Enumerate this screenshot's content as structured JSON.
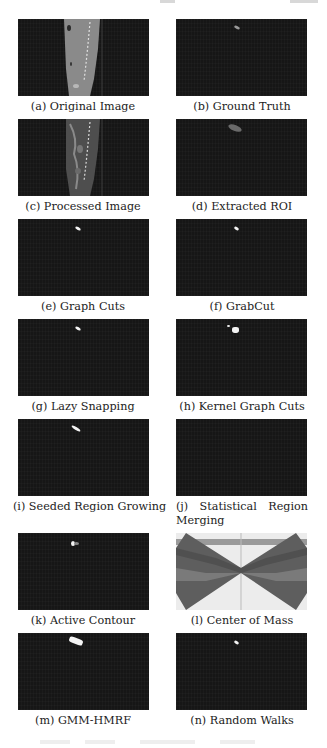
{
  "figure": {
    "panels": [
      {
        "id": "a",
        "caption": "(a) Original Image"
      },
      {
        "id": "b",
        "caption": "(b) Ground Truth"
      },
      {
        "id": "c",
        "caption": "(c) Processed Image"
      },
      {
        "id": "d",
        "caption": "(d) Extracted ROI"
      },
      {
        "id": "e",
        "caption": "(e) Graph Cuts"
      },
      {
        "id": "f",
        "caption": "(f) GrabCut"
      },
      {
        "id": "g",
        "caption": "(g) Lazy Snapping"
      },
      {
        "id": "h",
        "caption": "(h) Kernel Graph Cuts"
      },
      {
        "id": "i",
        "caption": "(i) Seeded Region Growing"
      },
      {
        "id": "j",
        "caption_parts": [
          "(j)",
          "Statistical",
          "Region",
          "Merging"
        ]
      },
      {
        "id": "k",
        "caption": "(k) Active Contour"
      },
      {
        "id": "l",
        "caption": "(l) Center of Mass"
      },
      {
        "id": "m",
        "caption": "(m) GMM-HMRF"
      },
      {
        "id": "n",
        "caption": "(n) Random Walks"
      }
    ],
    "colors": {
      "panel_background": "#161616",
      "segmentation_mask": "#f4f4f4",
      "center_of_mass_dark": "#5a5a5a",
      "center_of_mass_light": "#8a8a8a",
      "center_of_mass_bg": "#ececec"
    }
  }
}
